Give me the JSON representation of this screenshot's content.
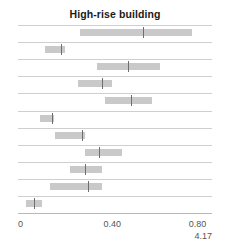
{
  "chart_data": {
    "type": "bar",
    "title": "High-rise building",
    "subtitle": "",
    "xlabel": "",
    "ylabel": "",
    "xlim": [
      0.0,
      0.824
    ],
    "grid": true,
    "legend": null,
    "orientation": "horizontal",
    "tick_labels": [
      "0",
      "0.40",
      "0.80"
    ],
    "ticks": [
      0.0,
      0.4,
      0.8
    ],
    "secondary_label": "4.17",
    "categories": [
      "row-1",
      "row-2",
      "row-3",
      "row-4",
      "row-5",
      "row-6",
      "row-7",
      "row-8",
      "row-9",
      "row-10",
      "row-11"
    ],
    "series": [
      {
        "name": "interval",
        "low": [
          0.264,
          0.115,
          0.336,
          0.255,
          0.37,
          0.094,
          0.157,
          0.285,
          0.221,
          0.136,
          0.034
        ],
        "high": [
          0.74,
          0.2,
          0.604,
          0.4,
          0.57,
          0.153,
          0.285,
          0.442,
          0.357,
          0.357,
          0.102
        ]
      },
      {
        "name": "estimate",
        "values": [
          0.531,
          0.183,
          0.468,
          0.357,
          0.48,
          0.145,
          0.272,
          0.344,
          0.285,
          0.298,
          0.068
        ]
      }
    ]
  }
}
